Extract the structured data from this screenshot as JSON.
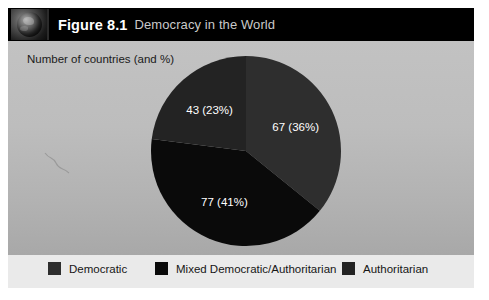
{
  "header": {
    "thumbnail_icon": "globe-icon",
    "figure_number": "Figure 8.1",
    "figure_title": "Democracy in the World"
  },
  "body": {
    "axis_note": "Number of countries (and %)"
  },
  "colors": {
    "panel_background": "#b3b3b3",
    "header_background": "#000000",
    "legend_background": "#eaeaea",
    "democratic": "#2e2e2e",
    "mixed": "#0a0a0a",
    "authoritarian": "#232323",
    "label_text": "#ffffff"
  },
  "chart_data": {
    "type": "pie",
    "title": "Democracy in the World",
    "subtitle": "Number of countries (and %)",
    "categories": [
      "Democratic",
      "Mixed Democratic/Authoritarian",
      "Authoritarian"
    ],
    "values": [
      67,
      77,
      43
    ],
    "percentages": [
      36,
      41,
      23
    ],
    "labels": [
      "67 (36%)",
      "77 (41%)",
      "43 (23%)"
    ],
    "colors": [
      "#2e2e2e",
      "#0a0a0a",
      "#232323"
    ],
    "start_angle_deg": 0,
    "direction": "clockwise",
    "total": 187,
    "legend_position": "bottom",
    "grid": false
  },
  "legend": {
    "items": [
      {
        "label": "Democratic",
        "color": "#2e2e2e"
      },
      {
        "label": "Mixed Democratic/Authoritarian",
        "color": "#0a0a0a"
      },
      {
        "label": "Authoritarian",
        "color": "#232323"
      }
    ]
  }
}
